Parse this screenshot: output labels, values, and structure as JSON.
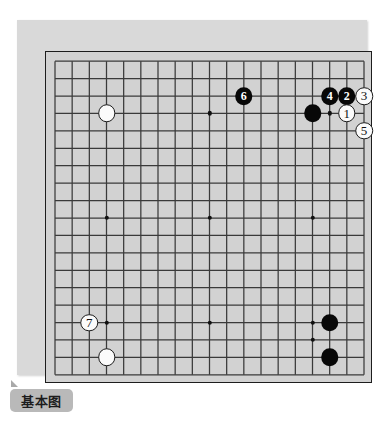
{
  "caption": {
    "label": "基本图"
  },
  "board": {
    "size": 19,
    "star_points": [
      {
        "col": 4,
        "row": 4
      },
      {
        "col": 10,
        "row": 4
      },
      {
        "col": 16,
        "row": 4
      },
      {
        "col": 4,
        "row": 10
      },
      {
        "col": 10,
        "row": 10
      },
      {
        "col": 16,
        "row": 10
      },
      {
        "col": 4,
        "row": 16
      },
      {
        "col": 10,
        "row": 16
      },
      {
        "col": 16,
        "row": 16
      }
    ],
    "colors": {
      "panel": "#d9d9d9",
      "grid_background": "#d2d2d2",
      "line": "#3a3a3a",
      "border": "#1d1d1d",
      "black_stone": "#080808",
      "white_stone": "#fbfbfb"
    },
    "stones": [
      {
        "id": "white-upper-left-star",
        "color": "white",
        "col": 4,
        "row": 4,
        "label": ""
      },
      {
        "id": "black-upper-right",
        "color": "black",
        "col": 16,
        "row": 4,
        "label": ""
      },
      {
        "id": "move-6",
        "color": "black",
        "col": 12,
        "row": 3,
        "label": "6"
      },
      {
        "id": "move-4",
        "color": "black",
        "col": 17,
        "row": 3,
        "label": "4"
      },
      {
        "id": "move-2",
        "color": "black",
        "col": 18,
        "row": 3,
        "label": "2"
      },
      {
        "id": "move-3",
        "color": "white",
        "col": 19,
        "row": 3,
        "label": "3"
      },
      {
        "id": "move-1",
        "color": "white",
        "col": 18,
        "row": 4,
        "label": "1"
      },
      {
        "id": "move-5",
        "color": "white",
        "col": 19,
        "row": 5,
        "label": "5"
      },
      {
        "id": "move-7",
        "color": "white",
        "col": 3,
        "row": 16,
        "label": "7"
      },
      {
        "id": "white-lower-left",
        "color": "white",
        "col": 4,
        "row": 18,
        "label": ""
      },
      {
        "id": "black-lower-right-a",
        "color": "black",
        "col": 17,
        "row": 16,
        "label": ""
      },
      {
        "id": "black-lower-right-b",
        "color": "black",
        "col": 17,
        "row": 18,
        "label": ""
      }
    ],
    "marker_dots": [
      {
        "id": "marker-upper-right",
        "col": 17,
        "row": 4
      },
      {
        "id": "marker-lower-right",
        "col": 16,
        "row": 17
      }
    ]
  }
}
